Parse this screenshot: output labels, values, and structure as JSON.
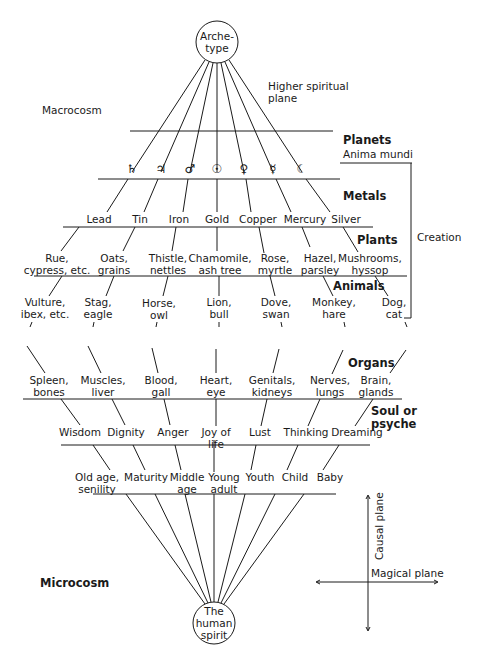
{
  "nodes": {
    "archetype": "Arche-\ntype",
    "human_spirit": "The\nhuman\nspirit"
  },
  "side_labels": {
    "macrocosm": "Macrocosm",
    "microcosm": "Microcosm",
    "higher_spiritual_plane": "Higher spiritual\nplane",
    "creation": "Creation"
  },
  "levels": {
    "planets": {
      "title": "Planets",
      "subtitle": "Anima mundi",
      "items": [
        {
          "name": "Saturn",
          "symbol": "♄"
        },
        {
          "name": "Jupiter",
          "symbol": "♃"
        },
        {
          "name": "Mars",
          "symbol": "♂"
        },
        {
          "name": "Sun",
          "symbol": "☉"
        },
        {
          "name": "Venus",
          "symbol": "♀"
        },
        {
          "name": "Mercury",
          "symbol": "☿"
        },
        {
          "name": "Moon",
          "symbol": "☾"
        }
      ]
    },
    "metals": {
      "title": "Metals",
      "items": [
        "Lead",
        "Tin",
        "Iron",
        "Gold",
        "Copper",
        "Mercury",
        "Silver"
      ]
    },
    "plants": {
      "title": "Plants",
      "items": [
        "Rue,\ncypress, etc.",
        "Oats,\ngrains",
        "Thistle,\nnettles",
        "Chamomile,\nash tree",
        "Rose,\nmyrtle",
        "Hazel,\nparsley",
        "Mushrooms,\nhyssop"
      ]
    },
    "animals": {
      "title": "Animals",
      "items": [
        "Vulture,\nibex, etc.",
        "Stag,\neagle",
        "Horse,\nowl",
        "Lion,\nbull",
        "Dove,\nswan",
        "Monkey,\nhare",
        "Dog,\ncat"
      ]
    },
    "organs": {
      "title": "Organs",
      "items": [
        "Spleen,\nbones",
        "Muscles,\nliver",
        "Blood,\ngall",
        "Heart,\neye",
        "Genitals,\nkidneys",
        "Nerves,\nlungs",
        "Brain,\nglands"
      ]
    },
    "psyche": {
      "title": "Soul or\npsyche",
      "items": [
        "Wisdom",
        "Dignity",
        "Anger",
        "Joy of\nlife",
        "Lust",
        "Thinking",
        "Dreaming"
      ]
    },
    "ages": {
      "items": [
        "Old age,\nsenility",
        "Maturity",
        "Middle\nage",
        "Young\nadult",
        "Youth",
        "Child",
        "Baby"
      ]
    }
  },
  "axes": {
    "vertical": "Causal plane",
    "horizontal": "Magical plane"
  }
}
